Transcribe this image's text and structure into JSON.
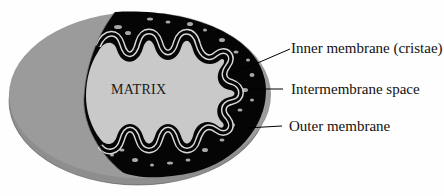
{
  "diagram": {
    "regions": {
      "matrix": {
        "label": "MATRIX",
        "color": "#c9c9c9"
      },
      "intermembrane_space": {
        "color": "#000000"
      },
      "outer_shell": {
        "color": "#9b9b9b"
      }
    },
    "labels": {
      "inner_membrane": "Inner membrane (cristae)",
      "intermembrane_space": "Intermembrane space",
      "outer_membrane": "Outer membrane"
    }
  }
}
